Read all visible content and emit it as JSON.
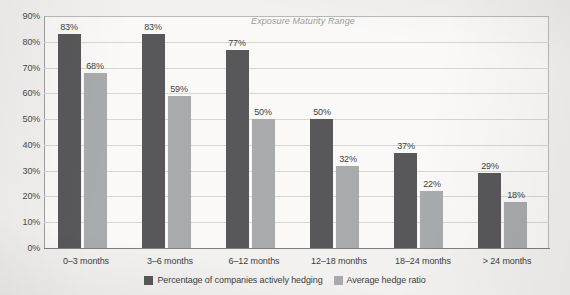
{
  "chart_data": {
    "type": "bar",
    "title": "Exposure Maturity Range",
    "xlabel": "",
    "ylabel": "",
    "ylim": [
      0,
      90
    ],
    "ytick_step": 10,
    "ytick_labels": [
      "0%",
      "10%",
      "20%",
      "30%",
      "40%",
      "50%",
      "60%",
      "70%",
      "80%",
      "90%"
    ],
    "grid": true,
    "legend_position": "bottom-center",
    "value_label_suffix": "%",
    "categories": [
      "0–3 months",
      "3–6 months",
      "6–12 months",
      "12–18 months",
      "18–24 months",
      "> 24 months"
    ],
    "series": [
      {
        "name": "Percentage of companies actively hedging",
        "color": "#58585a",
        "values": [
          83,
          83,
          77,
          50,
          37,
          29
        ],
        "value_labels": [
          "83%",
          "83%",
          "77%",
          "50%",
          "37%",
          "29%"
        ]
      },
      {
        "name": "Average hedge ratio",
        "color": "#a9aaac",
        "values": [
          68,
          59,
          50,
          32,
          22,
          18
        ],
        "value_labels": [
          "68%",
          "59%",
          "50%",
          "32%",
          "22%",
          "18%"
        ]
      }
    ]
  },
  "colors": {
    "series_dark": "#58585a",
    "series_light": "#a9aaac",
    "gridline": "#d6d6d4",
    "axis": "#7f7f7f",
    "plot_background": "#faf9f7",
    "page_background": "#f2f1ef",
    "title_text": "#9a9a9a"
  }
}
